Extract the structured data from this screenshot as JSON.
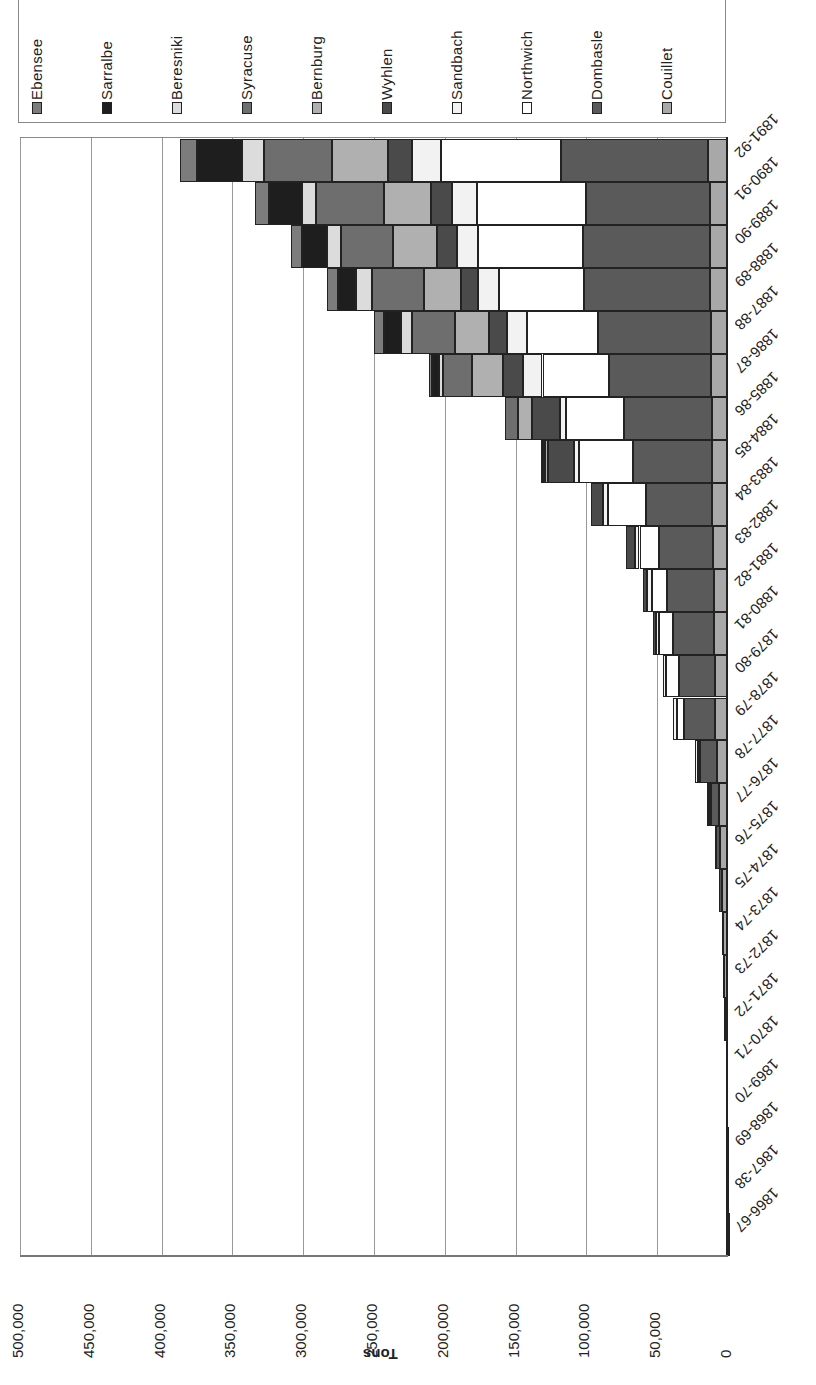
{
  "chart_data": {
    "type": "bar",
    "orientation": "rotated-90 stacked horizontal (value axis horizontal, 0 at right)",
    "stacked": true,
    "title": "",
    "xlabel": "",
    "ylabel": "Tons",
    "ylim": [
      0,
      500000
    ],
    "y_ticks": [
      "500,000",
      "450,000",
      "400,000",
      "350,000",
      "300,000",
      "250,000",
      "200,000",
      "150,000",
      "100,000",
      "50,000",
      "0"
    ],
    "grid": true,
    "legend_position": "top",
    "categories": [
      "1866-67",
      "1867-38",
      "1868-69",
      "1869-70",
      "1870-71",
      "1871-72",
      "1872-73",
      "1873-74",
      "1874-75",
      "1875-76",
      "1876-77",
      "1877-78",
      "1878-79",
      "1879-80",
      "1880-81",
      "1881-82",
      "1882-83",
      "1883-84",
      "1884-85",
      "1885-86",
      "1886-87",
      "1887-88",
      "1888-89",
      "1889-90",
      "1890-91",
      "1891-92"
    ],
    "series": [
      {
        "name": "Couillet",
        "color": "#a8a8a8",
        "values": [
          300,
          800,
          1000,
          1200,
          1500,
          2000,
          2500,
          3500,
          4500,
          5500,
          6500,
          8000,
          9000,
          9500,
          10000,
          10000,
          10500,
          11000,
          11000,
          11500,
          12000,
          12000,
          12500,
          12500,
          13000,
          14000
        ]
      },
      {
        "name": "Dombasle",
        "color": "#5a5a5a",
        "values": [
          0,
          0,
          0,
          0,
          0,
          500,
          800,
          1000,
          2000,
          3000,
          5500,
          12000,
          22000,
          25000,
          29000,
          33000,
          38000,
          47000,
          56000,
          62000,
          72000,
          80000,
          89000,
          90000,
          87000,
          104000
        ]
      },
      {
        "name": "Northwich",
        "color": "#ffffff",
        "values": [
          0,
          0,
          0,
          0,
          0,
          0,
          0,
          0,
          0,
          0,
          1500,
          1500,
          5000,
          9000,
          10000,
          11000,
          14000,
          27000,
          38000,
          41000,
          47000,
          50000,
          60000,
          74000,
          77000,
          85000
        ]
      },
      {
        "name": "Sandbach",
        "color": "#f2f2f2",
        "values": [
          0,
          0,
          0,
          0,
          0,
          0,
          0,
          0,
          0,
          500,
          1000,
          1500,
          3000,
          2500,
          2000,
          3000,
          3500,
          3000,
          4000,
          4000,
          14000,
          14000,
          15000,
          15000,
          18000,
          20000
        ]
      },
      {
        "name": "Wyhlen",
        "color": "#4a4a4a",
        "values": [
          0,
          0,
          0,
          0,
          0,
          0,
          0,
          0,
          0,
          0,
          0,
          0,
          0,
          0,
          2000,
          3000,
          6000,
          9000,
          18000,
          20000,
          14000,
          13000,
          12000,
          14000,
          15000,
          17000
        ]
      },
      {
        "name": "Bernburg",
        "color": "#b0b0b0",
        "values": [
          0,
          0,
          0,
          0,
          0,
          0,
          0,
          0,
          0,
          0,
          0,
          0,
          0,
          0,
          0,
          0,
          0,
          0,
          2000,
          10000,
          22000,
          24000,
          26000,
          31000,
          33000,
          40000
        ]
      },
      {
        "name": "Syracuse",
        "color": "#6e6e6e",
        "values": [
          0,
          0,
          0,
          0,
          0,
          0,
          0,
          0,
          0,
          0,
          0,
          0,
          0,
          0,
          0,
          0,
          0,
          0,
          0,
          9000,
          20000,
          30000,
          37000,
          37000,
          48000,
          48000
        ]
      },
      {
        "name": "Beresniki",
        "color": "#dcdcdc",
        "values": [
          0,
          0,
          0,
          0,
          0,
          0,
          0,
          0,
          0,
          0,
          0,
          0,
          0,
          0,
          0,
          0,
          0,
          0,
          1000,
          0,
          3000,
          8000,
          11000,
          10000,
          10000,
          15000
        ]
      },
      {
        "name": "Sarralbe",
        "color": "#1e1e1e",
        "values": [
          0,
          0,
          0,
          0,
          0,
          0,
          0,
          0,
          0,
          0,
          0,
          0,
          0,
          0,
          0,
          0,
          0,
          0,
          1000,
          0,
          5000,
          12000,
          13000,
          17000,
          23000,
          32000
        ]
      },
      {
        "name": "Ebensee",
        "color": "#7c7c7c",
        "values": [
          0,
          0,
          0,
          0,
          0,
          0,
          0,
          0,
          0,
          0,
          0,
          0,
          0,
          0,
          0,
          0,
          0,
          0,
          1000,
          0,
          2000,
          7000,
          8000,
          8000,
          10000,
          12000
        ]
      }
    ],
    "totals_approx": [
      300,
      800,
      1000,
      1200,
      1500,
      2500,
      3300,
      4500,
      6500,
      9000,
      16000,
      23000,
      39000,
      46000,
      53000,
      60000,
      72000,
      97000,
      132000,
      157000,
      211000,
      250000,
      283000,
      308000,
      334000,
      387000
    ]
  },
  "legend": {
    "items": [
      {
        "label": "Ebensee",
        "color": "#7c7c7c"
      },
      {
        "label": "Sarralbe",
        "color": "#1e1e1e"
      },
      {
        "label": "Beresniki",
        "color": "#dcdcdc"
      },
      {
        "label": "Syracuse",
        "color": "#6e6e6e"
      },
      {
        "label": "Bernburg",
        "color": "#b0b0b0"
      },
      {
        "label": "Wyhlen",
        "color": "#4a4a4a"
      },
      {
        "label": "Sandbach",
        "color": "#f2f2f2"
      },
      {
        "label": "Northwich",
        "color": "#ffffff"
      },
      {
        "label": "Dombasle",
        "color": "#5a5a5a"
      },
      {
        "label": "Couillet",
        "color": "#a8a8a8"
      }
    ]
  },
  "axis": {
    "ylabel": "Tons",
    "ticks": [
      "500,000",
      "450,000",
      "400,000",
      "350,000",
      "300,000",
      "250,000",
      "200,000",
      "150,000",
      "100,000",
      "50,000",
      "0"
    ]
  }
}
